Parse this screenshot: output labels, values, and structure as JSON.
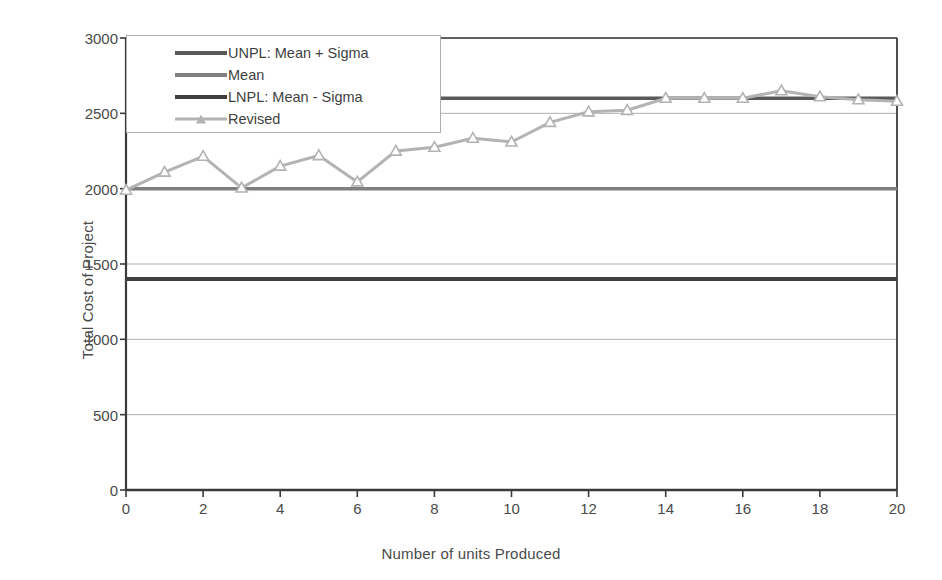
{
  "chart_data": {
    "type": "line",
    "title": "",
    "xlabel": "Number of units Produced",
    "ylabel": "Total Cost of Project",
    "xlim": [
      0,
      20
    ],
    "ylim": [
      0,
      3000
    ],
    "xticks": [
      0,
      2,
      4,
      6,
      8,
      10,
      12,
      14,
      16,
      18,
      20
    ],
    "yticks": [
      0,
      500,
      1000,
      1500,
      2000,
      2500,
      3000
    ],
    "grid": "horizontal",
    "legend_position": "top-left-inside",
    "x": [
      0,
      1,
      2,
      3,
      4,
      5,
      6,
      7,
      8,
      9,
      10,
      11,
      12,
      13,
      14,
      15,
      16,
      17,
      18,
      19,
      20
    ],
    "series": [
      {
        "name": "UNPL: Mean +  Sigma",
        "type": "constant-line",
        "value": 2600,
        "color": "#595959",
        "width": 3.5,
        "values": [
          2600,
          2600,
          2600,
          2600,
          2600,
          2600,
          2600,
          2600,
          2600,
          2600,
          2600,
          2600,
          2600,
          2600,
          2600,
          2600,
          2600,
          2600,
          2600,
          2600,
          2600
        ]
      },
      {
        "name": "Mean",
        "type": "constant-line",
        "value": 2000,
        "color": "#7f7f7f",
        "width": 3.5,
        "values": [
          2000,
          2000,
          2000,
          2000,
          2000,
          2000,
          2000,
          2000,
          2000,
          2000,
          2000,
          2000,
          2000,
          2000,
          2000,
          2000,
          2000,
          2000,
          2000,
          2000,
          2000
        ]
      },
      {
        "name": "LNPL: Mean - Sigma",
        "type": "constant-line",
        "value": 1400,
        "color": "#3f3f3f",
        "width": 4,
        "values": [
          1400,
          1400,
          1400,
          1400,
          1400,
          1400,
          1400,
          1400,
          1400,
          1400,
          1400,
          1400,
          1400,
          1400,
          1400,
          1400,
          1400,
          1400,
          1400,
          1400,
          1400
        ]
      },
      {
        "name": "Revised",
        "type": "line-marker",
        "marker": "triangle",
        "color": "#b3b3b3",
        "width": 3,
        "values": [
          1990,
          2110,
          2215,
          2005,
          2150,
          2220,
          2045,
          2250,
          2275,
          2335,
          2310,
          2440,
          2510,
          2520,
          2600,
          2600,
          2600,
          2650,
          2610,
          2590,
          2580
        ]
      }
    ]
  },
  "legend": {
    "items": [
      {
        "label": "UNPL: Mean +  Sigma",
        "color": "#595959",
        "marker": false
      },
      {
        "label": "Mean",
        "color": "#7f7f7f",
        "marker": false
      },
      {
        "label": "LNPL: Mean - Sigma",
        "color": "#3f3f3f",
        "marker": false
      },
      {
        "label": "Revised",
        "color": "#b3b3b3",
        "marker": true
      }
    ]
  },
  "axes": {
    "y_title": "Total Cost of Project",
    "x_title": "Number of units Produced",
    "y_labels": [
      "3000",
      "2500",
      "2000",
      "1500",
      "1000",
      "500",
      "0"
    ],
    "x_labels": [
      "0",
      "2",
      "4",
      "6",
      "8",
      "10",
      "12",
      "14",
      "16",
      "18",
      "20"
    ]
  },
  "colors": {
    "axis": "#3a3a3a",
    "grid": "#b0b0b0",
    "text": "#4a4a4a",
    "background": "#ffffff"
  }
}
